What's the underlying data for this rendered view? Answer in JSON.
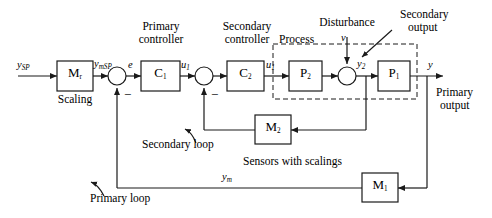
{
  "diagram": {
    "stroke_color": "#1a1a1a",
    "background": "#ffffff"
  },
  "blocks": {
    "scaling": {
      "symbol": "M",
      "subscript": "r",
      "caption": "Scaling"
    },
    "primary_controller": {
      "symbol": "C",
      "subscript": "1",
      "caption_line1": "Primary",
      "caption_line2": "controller"
    },
    "secondary_controller": {
      "symbol": "C",
      "subscript": "2",
      "caption_line1": "Secondary",
      "caption_line2": "controller"
    },
    "process_inner": {
      "symbol": "P",
      "subscript": "2"
    },
    "process_outer": {
      "symbol": "P",
      "subscript": "1"
    },
    "sensor_secondary": {
      "symbol": "M",
      "subscript": "2"
    },
    "sensor_primary": {
      "symbol": "M",
      "subscript": "1"
    }
  },
  "signals": {
    "setpoint": {
      "symbol": "y",
      "subscript": "SP"
    },
    "scaled_setpoint": {
      "symbol": "y",
      "subscript": "mSP"
    },
    "error": {
      "symbol": "e",
      "subscript": ""
    },
    "primary_control_output": {
      "symbol": "u",
      "subscript": "1"
    },
    "secondary_control_output": {
      "symbol": "u",
      "subscript": "1"
    },
    "disturbance": {
      "symbol": "v",
      "subscript": ""
    },
    "secondary_output": {
      "symbol": "y",
      "subscript": "2"
    },
    "primary_output": {
      "symbol": "y",
      "subscript": ""
    },
    "measured_primary": {
      "symbol": "y",
      "subscript": "m"
    }
  },
  "annotations": {
    "disturbance_label": "Disturbance",
    "secondary_output_line1": "Secondary",
    "secondary_output_line2": "output",
    "process_label": "Process",
    "primary_output_line1": "Primary",
    "primary_output_line2": "output",
    "secondary_loop_label": "Secondary loop",
    "primary_loop_label": "Primary loop",
    "sensors_label": "Sensors with scalings",
    "minus_sign": "−"
  }
}
